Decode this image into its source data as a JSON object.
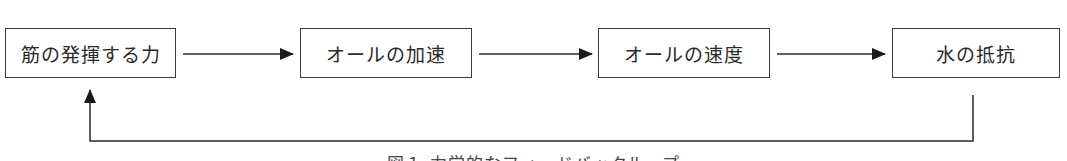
{
  "diagram": {
    "nodes": [
      {
        "id": "muscle-force",
        "label": "筋の発揮する力"
      },
      {
        "id": "oar-acceleration",
        "label": "オールの加速"
      },
      {
        "id": "oar-velocity",
        "label": "オールの速度"
      },
      {
        "id": "water-resistance",
        "label": "水の抵抗"
      }
    ],
    "edges": [
      {
        "from": "muscle-force",
        "to": "oar-acceleration"
      },
      {
        "from": "oar-acceleration",
        "to": "oar-velocity"
      },
      {
        "from": "oar-velocity",
        "to": "water-resistance"
      },
      {
        "from": "water-resistance",
        "to": "muscle-force",
        "type": "feedback"
      }
    ],
    "caption": "図１ 力学的なフィードバックループ"
  }
}
